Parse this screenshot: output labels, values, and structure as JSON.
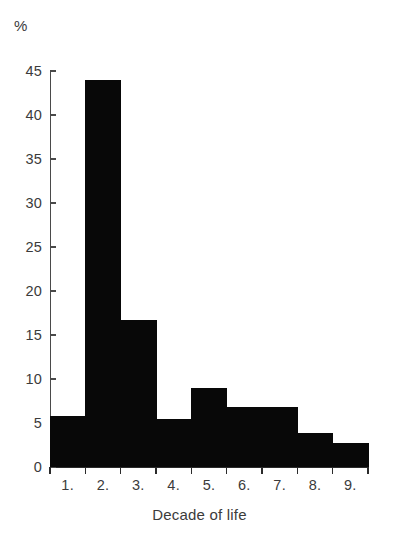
{
  "chart_data": {
    "type": "bar",
    "title": "",
    "subtitle": "",
    "xlabel": "Decade of life",
    "ylabel": "%",
    "categories": [
      "1.",
      "2.",
      "3.",
      "4.",
      "5.",
      "6.",
      "7.",
      "8.",
      "9."
    ],
    "values": [
      5.8,
      44.0,
      16.7,
      5.5,
      9.0,
      6.8,
      6.8,
      3.9,
      2.7
    ],
    "ylim": [
      0,
      45
    ],
    "ytick_labels": [
      "0",
      "5",
      "10",
      "15",
      "20",
      "25",
      "30",
      "35",
      "40",
      "45"
    ],
    "ytick_values": [
      0,
      5,
      10,
      15,
      20,
      25,
      30,
      35,
      40,
      45
    ],
    "grid": false,
    "legend": null,
    "legend_position": "none",
    "bar_color": "#080808",
    "axis_color": "#2b2b2b",
    "text_color": "#3b3b3b",
    "background_color": "#ffffff",
    "annotations": []
  },
  "axes": {
    "y_unit_label": "%",
    "x_title": "Decade of life"
  }
}
